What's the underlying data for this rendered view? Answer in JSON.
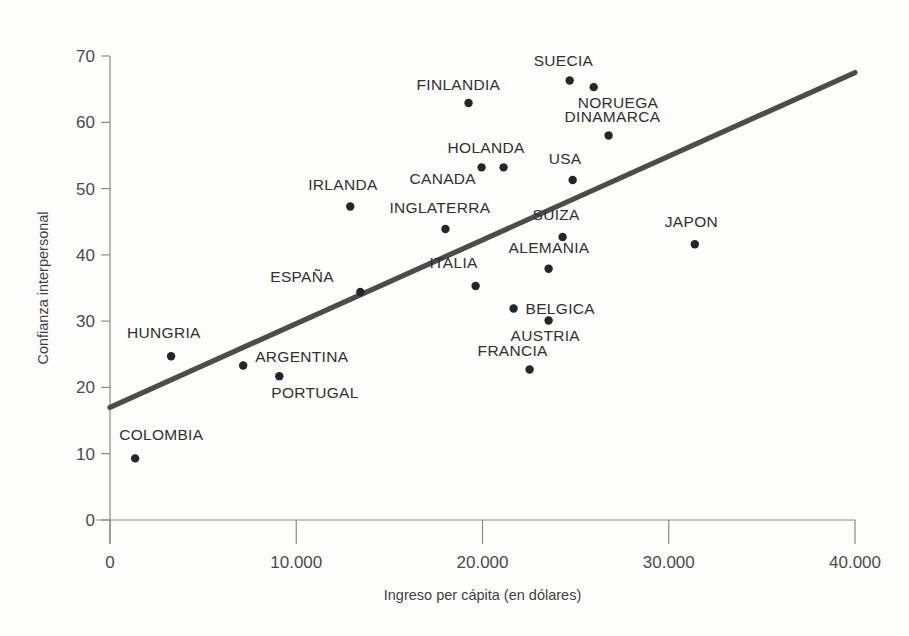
{
  "chart_data": {
    "type": "scatter",
    "title": "",
    "xlabel": "Ingreso per cápita (en dólares)",
    "ylabel": "Confianza interpersonal",
    "xlim": [
      0,
      40000
    ],
    "ylim": [
      0,
      70
    ],
    "grid": false,
    "legend": "none",
    "xticks": [
      0,
      10000,
      20000,
      30000,
      40000
    ],
    "xticklabels": [
      "0",
      "10.000",
      "20.000",
      "30.000",
      "40.000"
    ],
    "yticks": [
      0,
      10,
      20,
      30,
      40,
      50,
      60,
      70
    ],
    "yticklabels": [
      "0",
      "10",
      "20",
      "30",
      "40",
      "50",
      "60",
      "70"
    ],
    "point_color": "#262626",
    "line_color": "#4e4c4a",
    "trendline": {
      "label": "trendline",
      "x": [
        0,
        40000
      ],
      "y": [
        17.0,
        67.5
      ]
    },
    "points": [
      {
        "label": "COLOMBIA",
        "x": 1350,
        "y": 9.3,
        "label_dx": -16,
        "label_dy": -18
      },
      {
        "label": "HUNGRIA",
        "x": 3280,
        "y": 24.7,
        "label_dx": -44,
        "label_dy": -18
      },
      {
        "label": "ARGENTINA",
        "x": 7150,
        "y": 23.3,
        "label_dx": 12,
        "label_dy": -4
      },
      {
        "label": "PORTUGAL",
        "x": 9090,
        "y": 21.7,
        "label_dx": -8,
        "label_dy": 22
      },
      {
        "label": "IRLANDA",
        "x": 12900,
        "y": 47.3,
        "label_dx": -42,
        "label_dy": -16
      },
      {
        "label": "ESPAÑA",
        "x": 13440,
        "y": 34.4,
        "label_dx": -90,
        "label_dy": -10
      },
      {
        "label": "INGLATERRA",
        "x": 18010,
        "y": 43.9,
        "label_dx": -56,
        "label_dy": -16
      },
      {
        "label": "ITALIA",
        "x": 19630,
        "y": 35.3,
        "label_dx": -46,
        "label_dy": -18
      },
      {
        "label": "FINLANDIA",
        "x": 19250,
        "y": 62.9,
        "label_dx": -52,
        "label_dy": -13
      },
      {
        "label": "CANADA",
        "x": 19950,
        "y": 53.2,
        "label_dx": -72,
        "label_dy": 17
      },
      {
        "label": "HOLANDA",
        "x": 21130,
        "y": 53.2,
        "label_dx": -56,
        "label_dy": -14
      },
      {
        "label": "FRANCIA",
        "x": 22530,
        "y": 22.7,
        "label_dx": -52,
        "label_dy": -14
      },
      {
        "label": "BELGICA",
        "x": 21670,
        "y": 31.9,
        "label_dx": 12,
        "label_dy": 5
      },
      {
        "label": "ALEMANIA",
        "x": 23550,
        "y": 37.9,
        "label_dx": -40,
        "label_dy": -16
      },
      {
        "label": "AUSTRIA",
        "x": 23550,
        "y": 30.1,
        "label_dx": -38,
        "label_dy": 21
      },
      {
        "label": "SUIZA",
        "x": 24300,
        "y": 42.7,
        "label_dx": -30,
        "label_dy": -17
      },
      {
        "label": "USA",
        "x": 24840,
        "y": 51.3,
        "label_dx": -24,
        "label_dy": -16
      },
      {
        "label": "SUECIA",
        "x": 24680,
        "y": 66.3,
        "label_dx": -36,
        "label_dy": -15
      },
      {
        "label": "NORUEGA",
        "x": 25970,
        "y": 65.3,
        "label_dx": -16,
        "label_dy": 21
      },
      {
        "label": "DINAMARCA",
        "x": 26770,
        "y": 58.0,
        "label_dx": -44,
        "label_dy": -14
      },
      {
        "label": "JAPON",
        "x": 31400,
        "y": 41.6,
        "label_dx": -30,
        "label_dy": -17
      }
    ]
  }
}
